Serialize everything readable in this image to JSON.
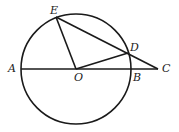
{
  "diagram": {
    "type": "geometry",
    "circle": {
      "center": "O",
      "cx": 76,
      "cy": 69,
      "r": 55
    },
    "points": {
      "A": {
        "label": "A",
        "x": 21,
        "y": 69,
        "lx": 8,
        "ly": 72
      },
      "B": {
        "label": "B",
        "x": 131,
        "y": 69,
        "lx": 133,
        "ly": 81
      },
      "C": {
        "label": "C",
        "x": 158,
        "y": 69,
        "lx": 162,
        "ly": 72
      },
      "D": {
        "label": "D",
        "x": 128,
        "y": 53,
        "lx": 130,
        "ly": 51
      },
      "E": {
        "label": "E",
        "x": 56,
        "y": 17,
        "lx": 50,
        "ly": 14
      },
      "O": {
        "label": "O",
        "x": 76,
        "y": 69,
        "lx": 74,
        "ly": 81
      }
    },
    "segments": [
      [
        "A",
        "C"
      ],
      [
        "E",
        "C"
      ],
      [
        "O",
        "E"
      ],
      [
        "O",
        "D"
      ]
    ],
    "colors": {
      "stroke": "#1a1a1a",
      "background": "#ffffff"
    }
  }
}
